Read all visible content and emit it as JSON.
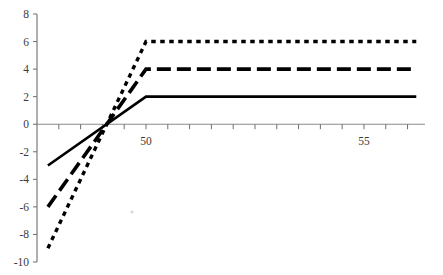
{
  "chart_data": {
    "type": "line",
    "title": "",
    "subtitle": "",
    "xlabel": "",
    "ylabel": "",
    "xlim": [
      47.5,
      56.4
    ],
    "ylim": [
      -10,
      8
    ],
    "xticks": [
      48,
      48.5,
      49,
      49.5,
      50,
      50.5,
      51,
      51.5,
      52,
      52.5,
      53,
      53.5,
      54,
      54.5,
      55,
      55.5,
      56
    ],
    "xtick_labels": [
      {
        "value": 50,
        "label": "50"
      },
      {
        "value": 55,
        "label": "55"
      }
    ],
    "yticks": [
      -10,
      -8,
      -6,
      -4,
      -2,
      0,
      2,
      4,
      6,
      8
    ],
    "ytick_labels": [
      "8",
      "6",
      "4",
      "2",
      "0",
      "-2",
      "-4",
      "-6",
      "-8",
      "-10"
    ],
    "grid": false,
    "legend": "none",
    "zero_line": true,
    "series": [
      {
        "name": "solid",
        "style": "solid",
        "x": [
          47.75,
          50,
          56.2
        ],
        "values": [
          -3,
          2,
          2
        ],
        "kink_x": 50,
        "left_value": -3,
        "plateau_value": 2
      },
      {
        "name": "dashed",
        "style": "dashed",
        "x": [
          47.75,
          50,
          56.2
        ],
        "values": [
          -6,
          4,
          4
        ],
        "kink_x": 50,
        "left_value": -6,
        "plateau_value": 4
      },
      {
        "name": "dotted",
        "style": "dotted",
        "x": [
          47.75,
          50,
          56.2
        ],
        "values": [
          -9,
          6,
          6
        ],
        "kink_x": 50,
        "left_value": -9,
        "plateau_value": 6
      }
    ],
    "crossing_point": {
      "x": 49.1,
      "y": 0
    },
    "colors": {
      "series": "#000000",
      "axis": "#6e6e6e",
      "zero_line": "#8a8a8a",
      "text": "#3b3b3b",
      "background": "#ffffff"
    }
  }
}
